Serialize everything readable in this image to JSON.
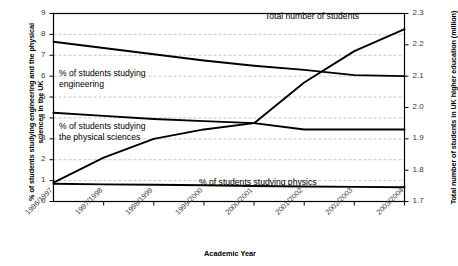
{
  "chart_data": {
    "type": "line",
    "title": "",
    "xlabel": "Academic Year",
    "ylabel": "% of students studying engineering and the physical sciences in the UK",
    "ylabel_right": "Total number of students in UK higher education (million)",
    "categories": [
      "1996/1997",
      "1997/1998",
      "1998/1999",
      "1999/2000",
      "2000/2001",
      "2001/2002",
      "2002/2003",
      "2003/2004"
    ],
    "ylim": [
      0,
      9
    ],
    "yticks": [
      "0",
      "1",
      "2",
      "3",
      "4",
      "5",
      "6",
      "7",
      "8",
      "9"
    ],
    "ylim_right": [
      1.7,
      2.3
    ],
    "yticks_right": [
      "1.7",
      "1.8",
      "1.9",
      "2.0",
      "2.1",
      "2.2",
      "2.3"
    ],
    "grid": true,
    "legend_position": "inline-annotations",
    "series": [
      {
        "name": "% of students studying engineering",
        "axis": "left",
        "values": [
          7.65,
          7.35,
          7.05,
          6.75,
          6.5,
          6.3,
          6.05,
          6.0
        ]
      },
      {
        "name": "% of students studying the physical sciences",
        "axis": "left",
        "values": [
          4.25,
          4.1,
          3.95,
          3.85,
          3.75,
          3.45,
          3.45,
          3.45
        ]
      },
      {
        "name": "% of students studying physics",
        "axis": "left",
        "values": [
          0.85,
          0.82,
          0.8,
          0.78,
          0.74,
          0.72,
          0.7,
          0.68
        ]
      },
      {
        "name": "Total number of students",
        "axis": "right",
        "values": [
          1.76,
          1.84,
          1.9,
          1.93,
          1.95,
          2.08,
          2.18,
          2.25
        ],
        "values_left_scale": [
          0.85,
          2.05,
          2.95,
          3.4,
          3.7,
          5.65,
          7.15,
          8.25
        ]
      }
    ],
    "annotations": [
      {
        "id": "annot-engineering",
        "text": "% of students studying\nengineering"
      },
      {
        "id": "annot-physical-sciences",
        "text": "% of students studying\nthe physical sciences"
      },
      {
        "id": "annot-physics",
        "text": "% of students studying physics"
      },
      {
        "id": "annot-total",
        "text": "Total number of students"
      }
    ]
  },
  "axes": {
    "left_title": "% of students studying engineering and the\nphysical sciences in the UK",
    "right_title": "Total number of students in UK higher\neducation (million)",
    "x_title": "Academic Year"
  },
  "colors": {
    "line": "#000000",
    "grid": "#b9b9b9",
    "axis": "#000000",
    "tick_text": "#3a3a3a",
    "background": "#ffffff"
  }
}
